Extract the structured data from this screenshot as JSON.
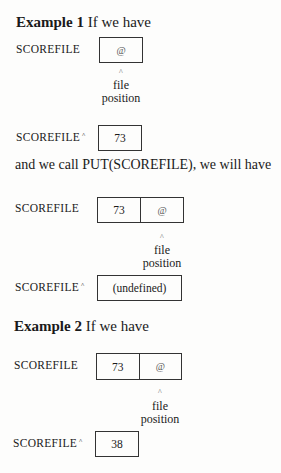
{
  "example1": {
    "heading_bold": "Example 1",
    "heading_rest": "If we have",
    "file_label": "SCOREFILE",
    "file_cells": [
      "@"
    ],
    "caret": "^",
    "position_label_1": "file",
    "position_label_2": "position",
    "buffer_label": "SCOREFILE",
    "buffer_sup": "^",
    "buffer_value": "73"
  },
  "transition": {
    "text": "and we call PUT(SCOREFILE), we will have"
  },
  "result1": {
    "file_label": "SCOREFILE",
    "file_cells": [
      "73",
      "@"
    ],
    "caret": "^",
    "position_label_1": "file",
    "position_label_2": "position",
    "buffer_label": "SCOREFILE",
    "buffer_sup": "^",
    "buffer_value": "(undefined)"
  },
  "example2": {
    "heading_bold": "Example 2",
    "heading_rest": "If we have",
    "file_label": "SCOREFILE",
    "file_cells": [
      "73",
      "@"
    ],
    "caret": "^",
    "position_label_1": "file",
    "position_label_2": "position",
    "buffer_label": "SCOREFILE",
    "buffer_sup": "^",
    "buffer_value": "38"
  }
}
